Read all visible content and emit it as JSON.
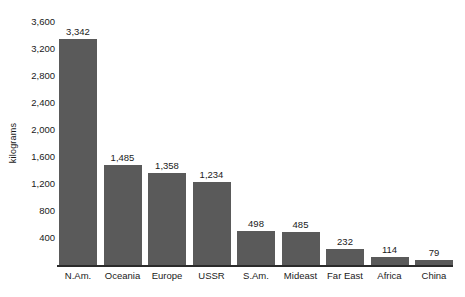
{
  "chart_data": {
    "type": "bar",
    "title": "",
    "xlabel": "",
    "ylabel": "kilograms",
    "categories": [
      "N.Am.",
      "Oceania",
      "Europe",
      "USSR",
      "S.Am.",
      "Mideast",
      "Far East",
      "Africa",
      "China"
    ],
    "values": [
      3342,
      1485,
      1358,
      1234,
      498,
      485,
      232,
      114,
      79
    ],
    "value_labels": [
      "3,342",
      "1,485",
      "1,358",
      "1,234",
      "498",
      "485",
      "232",
      "114",
      "79"
    ],
    "ylim": [
      0,
      3600
    ],
    "yticks": [
      3600,
      3200,
      2800,
      2400,
      2000,
      1600,
      1200,
      800,
      400
    ],
    "ytick_labels": [
      "3,600",
      "3,200",
      "2,800",
      "2,400",
      "2,000",
      "1,600",
      "1,200",
      "800",
      "400"
    ],
    "grid": false,
    "legend": null,
    "bar_color": "#5a5a5a",
    "axis_color": "#2b2b2b",
    "text_color": "#1a1a1a",
    "background": "#ffffff"
  }
}
